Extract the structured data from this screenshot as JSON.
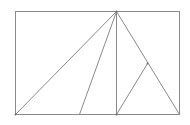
{
  "diagram": {
    "type": "geometry",
    "canvas": {
      "width": 190,
      "height": 125,
      "background": "#ffffff"
    },
    "stroke_color": "#8a8a8a",
    "rectangle": {
      "x1": 15,
      "y1": 11,
      "x2": 179,
      "y2": 114
    },
    "points": {
      "top_left": [
        15,
        11
      ],
      "top_right": [
        179,
        11
      ],
      "bottom_left": [
        15,
        114
      ],
      "bottom_right": [
        179,
        114
      ],
      "apex": [
        116,
        11
      ],
      "bottom_mid_left": [
        79,
        114
      ],
      "foot": [
        116,
        114
      ],
      "right_slant_point": [
        147,
        63
      ]
    },
    "segments": [
      {
        "name": "apex-to-bottom-left",
        "from": "apex",
        "to": "bottom_left"
      },
      {
        "name": "apex-to-bottom-mid-left",
        "from": "apex",
        "to": "bottom_mid_left"
      },
      {
        "name": "apex-to-foot",
        "from": "apex",
        "to": "foot"
      },
      {
        "name": "apex-to-bottom-right",
        "from": "apex",
        "to": "bottom_right"
      },
      {
        "name": "foot-to-right-slant-point",
        "from": "foot",
        "to": "right_slant_point"
      }
    ],
    "labels": []
  }
}
